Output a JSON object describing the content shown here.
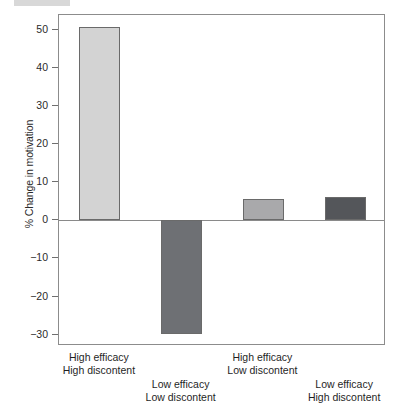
{
  "chart_data": {
    "type": "bar",
    "title": "",
    "subtitle": "",
    "xlabel": "",
    "ylabel": "% Change in motivation",
    "categories": [
      "High efficacy\nHigh discontent",
      "Low efficacy\nLow discontent",
      "High efficacy\nLow discontent",
      "Low efficacy\nHigh discontent"
    ],
    "category_lines": [
      [
        "High efficacy",
        "High discontent"
      ],
      [
        "Low efficacy",
        "Low discontent"
      ],
      [
        "High efficacy",
        "Low discontent"
      ],
      [
        "Low efficacy",
        "High discontent"
      ]
    ],
    "values": [
      50.8,
      -29.8,
      5.6,
      6.2
    ],
    "bar_colors": [
      "#d3d3d3",
      "#6e7074",
      "#a9a9ab",
      "#54565a"
    ],
    "ylim": [
      -33,
      54
    ],
    "yticks": [
      50,
      40,
      30,
      20,
      10,
      0,
      -10,
      -20,
      -30
    ],
    "ytick_labels": [
      "50",
      "40",
      "30",
      "20",
      "10",
      "0",
      "−10",
      "−20",
      "−30"
    ],
    "grid": false,
    "legend": null,
    "legend_position": "none",
    "baseline": 0,
    "label_rows": [
      0,
      1,
      0,
      1
    ],
    "axis_color": "#8c8c8c",
    "text_color": "#1f1f1f"
  }
}
